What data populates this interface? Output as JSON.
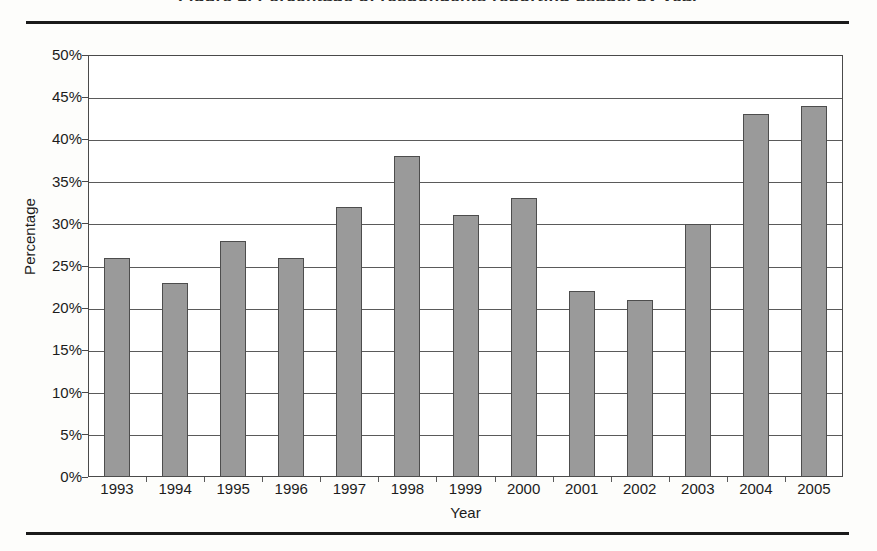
{
  "page": {
    "clipped_heading_text": "Figure 2. Percentage of respondents reporting usage, by year",
    "top_rule": "horizontal-rule",
    "bottom_rule": "horizontal-rule"
  },
  "chart_data": {
    "type": "bar",
    "title": "",
    "xlabel": "Year",
    "ylabel": "Percentage",
    "categories": [
      "1993",
      "1994",
      "1995",
      "1996",
      "1997",
      "1998",
      "1999",
      "2000",
      "2001",
      "2002",
      "2003",
      "2004",
      "2005"
    ],
    "values": [
      26,
      23,
      28,
      26,
      32,
      38,
      31,
      33,
      22,
      21,
      30,
      43,
      44
    ],
    "value_labels": [
      "26%",
      "23%",
      "28%",
      "26%",
      "32%",
      "38%",
      "31%",
      "33%",
      "22%",
      "21%",
      "30%",
      "43%",
      "44%"
    ],
    "ylim": [
      0,
      50
    ],
    "ytick_values": [
      0,
      5,
      10,
      15,
      20,
      25,
      30,
      35,
      40,
      45,
      50
    ],
    "ytick_labels": [
      "0%",
      "5%",
      "10%",
      "15%",
      "20%",
      "25%",
      "30%",
      "35%",
      "40%",
      "45%",
      "50%"
    ],
    "grid": "horizontal",
    "legend": "none",
    "series_color": "#9a9a9a",
    "series_border_color": "#4d4d4d",
    "axis_color": "#4a4a4a",
    "gridline_color": "#5a5a5a",
    "plot_background": "#ffffff"
  }
}
